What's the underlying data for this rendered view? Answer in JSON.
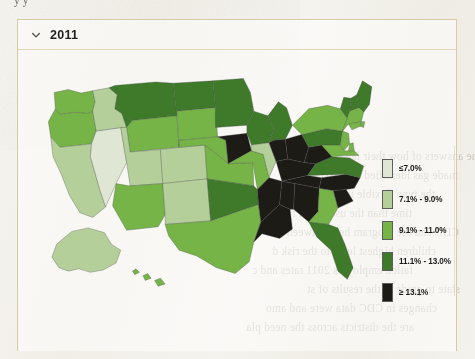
{
  "page": {
    "cut_off_text_above": "y                    y",
    "bleed_through_lines": [
      "the answers of how their latest",
      "made gas identified with AHA (CD",
      "the type flexible in attributing d",
      "time than the usual best report of",
      "CDC and the program here between",
      "children highest level to the risk d",
      "failed employers 2011 rates and c",
      "state to grade in the results of st",
      "changes in CDC data were and amo",
      "are the districts across the need pla"
    ]
  },
  "card": {
    "chevron_icon": "chevron-down-icon",
    "year_label": "2011",
    "expanded": true
  },
  "map": {
    "title": "2011",
    "projection": "albers-usa",
    "border_color": "#4a4a4a"
  },
  "legend": {
    "position": "right",
    "items": [
      {
        "label": "≤7.0%",
        "color": "#dfe7d4"
      },
      {
        "label": "7.1% - 9.0%",
        "color": "#b4cf9a"
      },
      {
        "label": "9.1% - 11.0%",
        "color": "#76b448"
      },
      {
        "label": "11.1% - 13.0%",
        "color": "#3e7a2a"
      },
      {
        "label": "≥ 13.1%",
        "color": "#1d1b16"
      }
    ]
  },
  "chart_data": {
    "type": "choropleth",
    "title": "2011",
    "value_unit": "percent",
    "bins": [
      {
        "label": "≤7.0%",
        "min": 0,
        "max": 7.0,
        "color": "#dfe7d4"
      },
      {
        "label": "7.1% - 9.0%",
        "min": 7.1,
        "max": 9.0,
        "color": "#b4cf9a"
      },
      {
        "label": "9.1% - 11.0%",
        "min": 9.1,
        "max": 11.0,
        "color": "#76b448"
      },
      {
        "label": "11.1% - 13.0%",
        "min": 11.1,
        "max": 13.0,
        "color": "#3e7a2a"
      },
      {
        "label": "≥ 13.1%",
        "min": 13.1,
        "max": null,
        "color": "#1d1b16"
      }
    ],
    "regions": [
      {
        "code": "WA",
        "name": "Washington",
        "bin": 2
      },
      {
        "code": "OR",
        "name": "Oregon",
        "bin": 2
      },
      {
        "code": "CA",
        "name": "California",
        "bin": 1
      },
      {
        "code": "NV",
        "name": "Nevada",
        "bin": 0
      },
      {
        "code": "ID",
        "name": "Idaho",
        "bin": 1
      },
      {
        "code": "MT",
        "name": "Montana",
        "bin": 3
      },
      {
        "code": "WY",
        "name": "Wyoming",
        "bin": 2
      },
      {
        "code": "UT",
        "name": "Utah",
        "bin": 1
      },
      {
        "code": "AZ",
        "name": "Arizona",
        "bin": 2
      },
      {
        "code": "CO",
        "name": "Colorado",
        "bin": 1
      },
      {
        "code": "NM",
        "name": "New Mexico",
        "bin": 1
      },
      {
        "code": "ND",
        "name": "North Dakota",
        "bin": 3
      },
      {
        "code": "SD",
        "name": "South Dakota",
        "bin": 2
      },
      {
        "code": "NE",
        "name": "Nebraska",
        "bin": 2
      },
      {
        "code": "KS",
        "name": "Kansas",
        "bin": 2
      },
      {
        "code": "OK",
        "name": "Oklahoma",
        "bin": 3
      },
      {
        "code": "TX",
        "name": "Texas",
        "bin": 2
      },
      {
        "code": "MN",
        "name": "Minnesota",
        "bin": 3
      },
      {
        "code": "IA",
        "name": "Iowa",
        "bin": 4
      },
      {
        "code": "MO",
        "name": "Missouri",
        "bin": 2
      },
      {
        "code": "AR",
        "name": "Arkansas",
        "bin": 4
      },
      {
        "code": "LA",
        "name": "Louisiana",
        "bin": 4
      },
      {
        "code": "WI",
        "name": "Wisconsin",
        "bin": 3
      },
      {
        "code": "IL",
        "name": "Illinois",
        "bin": 1
      },
      {
        "code": "MS",
        "name": "Mississippi",
        "bin": 4
      },
      {
        "code": "MI",
        "name": "Michigan",
        "bin": 3
      },
      {
        "code": "IN",
        "name": "Indiana",
        "bin": 4
      },
      {
        "code": "OH",
        "name": "Ohio",
        "bin": 4
      },
      {
        "code": "KY",
        "name": "Kentucky",
        "bin": 4
      },
      {
        "code": "TN",
        "name": "Tennessee",
        "bin": 4
      },
      {
        "code": "AL",
        "name": "Alabama",
        "bin": 4
      },
      {
        "code": "GA",
        "name": "Georgia",
        "bin": 2
      },
      {
        "code": "FL",
        "name": "Florida",
        "bin": 3
      },
      {
        "code": "SC",
        "name": "South Carolina",
        "bin": 4
      },
      {
        "code": "NC",
        "name": "North Carolina",
        "bin": 4
      },
      {
        "code": "VA",
        "name": "Virginia",
        "bin": 3
      },
      {
        "code": "WV",
        "name": "West Virginia",
        "bin": 4
      },
      {
        "code": "PA",
        "name": "Pennsylvania",
        "bin": 3
      },
      {
        "code": "NY",
        "name": "New York",
        "bin": 2
      },
      {
        "code": "VT",
        "name": "Vermont",
        "bin": 3
      },
      {
        "code": "NH",
        "name": "New Hampshire",
        "bin": 3
      },
      {
        "code": "ME",
        "name": "Maine",
        "bin": 3
      },
      {
        "code": "MA",
        "name": "Massachusetts",
        "bin": 2
      },
      {
        "code": "RI",
        "name": "Rhode Island",
        "bin": 2
      },
      {
        "code": "CT",
        "name": "Connecticut",
        "bin": 2
      },
      {
        "code": "NJ",
        "name": "New Jersey",
        "bin": 2
      },
      {
        "code": "DE",
        "name": "Delaware",
        "bin": 2
      },
      {
        "code": "MD",
        "name": "Maryland",
        "bin": 2
      },
      {
        "code": "AK",
        "name": "Alaska",
        "bin": 1
      },
      {
        "code": "HI",
        "name": "Hawaii",
        "bin": 2
      }
    ]
  }
}
